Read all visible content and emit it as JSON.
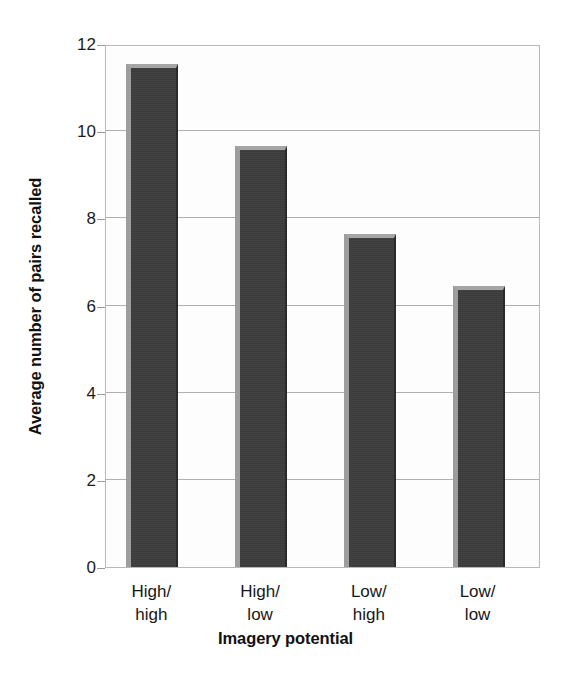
{
  "chart_data": {
    "type": "bar",
    "title": "",
    "subtitle": "",
    "xlabel": "Imagery potential",
    "ylabel": "Average number of pairs recalled",
    "categories": [
      "High/\nhigh",
      "High/\nlow",
      "Low/\nhigh",
      "Low/\nlow"
    ],
    "category_labels_flat": [
      "High/high",
      "High/low",
      "Low/high",
      "Low/low"
    ],
    "values": [
      11.55,
      9.65,
      7.65,
      6.45
    ],
    "ylim": [
      0,
      12
    ],
    "xlim": [
      0,
      4
    ],
    "y_ticks": [
      0,
      2,
      4,
      6,
      8,
      10,
      12
    ],
    "y_tick_labels": [
      "0",
      "2",
      "4",
      "6",
      "8",
      "10",
      "12"
    ],
    "grid": "horizontal",
    "legend": "none",
    "legend_position": "none",
    "series": [
      {
        "name": "Average number of pairs recalled",
        "values": [
          11.55,
          9.65,
          7.65,
          6.45
        ]
      }
    ],
    "annotations": []
  },
  "style": {
    "bar_face_color": "#3b3b3b",
    "bar_highlight_color": "#9d9d9d",
    "bar_top_color": "#a5a5a5",
    "bar_shadow_color": "#2a2a2a",
    "gridline_color": "#b0b0b0",
    "frame_color": "#b9b9b9",
    "plot_background": "#fdfdfd",
    "figure_background": "#ffffff",
    "text_color": "#1a1a1a"
  }
}
